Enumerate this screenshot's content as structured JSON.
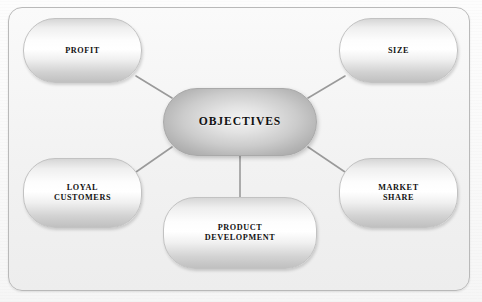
{
  "diagram": {
    "frame": {
      "border_color": "#b9b9b9",
      "background_color": "#f4f4f4"
    },
    "connector_color": "#9a9a9a",
    "center": {
      "id": "objectives",
      "label": "OBJECTIVES",
      "x": 163,
      "y": 88,
      "width": 154,
      "height": 68
    },
    "nodes": [
      {
        "id": "profit",
        "label": "PROFIT",
        "x": 23,
        "y": 18,
        "width": 119,
        "height": 65
      },
      {
        "id": "size",
        "label": "SIZE",
        "x": 339,
        "y": 18,
        "width": 119,
        "height": 65
      },
      {
        "id": "loyal-customers",
        "label": "LOYAL\nCUSTOMERS",
        "x": 23,
        "y": 158,
        "width": 119,
        "height": 70
      },
      {
        "id": "market-share",
        "label": "MARKET\nSHARE",
        "x": 339,
        "y": 158,
        "width": 119,
        "height": 70
      },
      {
        "id": "product-development",
        "label": "PRODUCT\nDEVELOPMENT",
        "x": 163,
        "y": 197,
        "width": 154,
        "height": 72
      }
    ],
    "connectors": [
      {
        "id": "center-to-profit",
        "x1": 172,
        "y1": 98,
        "x2": 136,
        "y2": 76
      },
      {
        "id": "center-to-size",
        "x1": 308,
        "y1": 98,
        "x2": 345,
        "y2": 76
      },
      {
        "id": "center-to-loyal-customers",
        "x1": 172,
        "y1": 147,
        "x2": 136,
        "y2": 172
      },
      {
        "id": "center-to-market-share",
        "x1": 308,
        "y1": 147,
        "x2": 345,
        "y2": 172
      },
      {
        "id": "center-to-product-development",
        "x1": 240,
        "y1": 156,
        "x2": 240,
        "y2": 199
      }
    ]
  }
}
